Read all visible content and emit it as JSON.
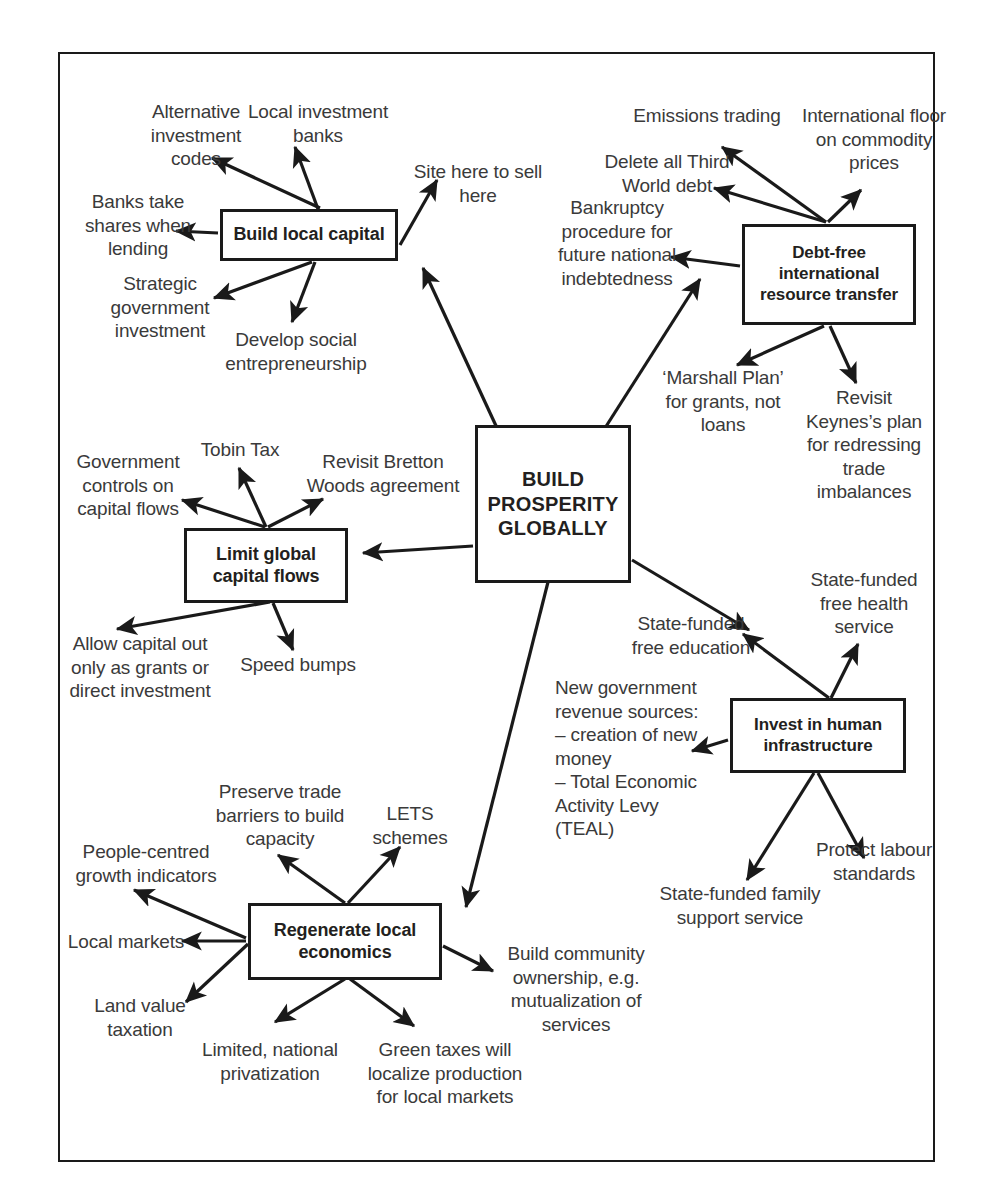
{
  "diagram": {
    "type": "mind-map",
    "title": "BUILD PROSPERITY GLOBALLY",
    "center": {
      "label": "BUILD\nPROSPERITY\nGLOBALLY"
    },
    "branches": [
      {
        "id": "build-local-capital",
        "label": "Build local capital",
        "leaves": [
          "Alternative\ninvestment\ncodes",
          "Local investment\nbanks",
          "Site here to sell\nhere",
          "Banks take\nshares when\nlending",
          "Strategic\ngovernment\ninvestment",
          "Develop social\nentrepreneurship"
        ]
      },
      {
        "id": "debt-free-international-resource-transfer",
        "label": "Debt-free\ninternational\nresource transfer",
        "leaves": [
          "Emissions trading",
          "International floor\non commodity\nprices",
          "Delete all Third\nWorld debt",
          "Bankruptcy\nprocedure for\nfuture national\nindebtedness",
          "‘Marshall Plan’\nfor grants, not\nloans",
          "Revisit\nKeynes’s plan\nfor redressing\ntrade\nimbalances"
        ]
      },
      {
        "id": "limit-global-capital-flows",
        "label": "Limit global\ncapital flows",
        "leaves": [
          "Tobin Tax",
          "Government\ncontrols on\ncapital flows",
          "Revisit Bretton\nWoods agreement",
          "Allow capital out\nonly as grants or\ndirect investment",
          "Speed bumps"
        ]
      },
      {
        "id": "invest-in-human-infrastructure",
        "label": "Invest in human\ninfrastructure",
        "leaves": [
          "State-funded\nfree education",
          "State-funded\nfree health\nservice",
          "New government\nrevenue sources:\n– creation of new\n   money\n– Total Economic\n   Activity Levy\n   (TEAL)",
          "Protect labour\nstandards",
          "State-funded family\nsupport service"
        ]
      },
      {
        "id": "regenerate-local-economics",
        "label": "Regenerate local\neconomics",
        "leaves": [
          "Preserve trade\nbarriers to build\ncapacity",
          "LETS\nschemes",
          "People-centred\ngrowth indicators",
          "Local markets",
          "Land value\ntaxation",
          "Limited, national\nprivatization",
          "Green taxes will\nlocalize production\nfor local markets",
          "Build community\nownership, e.g.\nmutualization of\nservices"
        ]
      }
    ],
    "colors": {
      "stroke": "#1a1a1a",
      "text": "#3a3a3a",
      "background": "#ffffff",
      "frame": "#1a1a1a"
    }
  }
}
